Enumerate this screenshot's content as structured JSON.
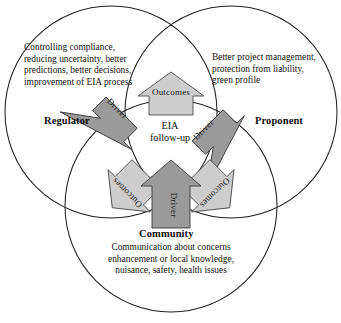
{
  "figure": {
    "type": "venn-diagram",
    "center": {
      "line1": "EIA",
      "line2": "follow-up"
    },
    "stakeholders": [
      {
        "id": "regulator",
        "name": "Regulator",
        "description_lines": [
          "Controlling compliance,",
          "reducing uncertainty, better",
          "predictions, better decisions,",
          "improvement of EIA process"
        ]
      },
      {
        "id": "proponent",
        "name": "Proponent",
        "description_lines": [
          "Better project management,",
          "protection from liability,",
          "green profile"
        ]
      },
      {
        "id": "community",
        "name": "Community",
        "description_lines": [
          "Communication about concerns",
          "enhancement or local knowledge,",
          "nuisance, safety, health issues"
        ]
      }
    ],
    "arrows": [
      {
        "id": "driver-regulator",
        "label": "Driver",
        "kind": "driver",
        "direction": "inward"
      },
      {
        "id": "driver-proponent",
        "label": "Driver",
        "kind": "driver",
        "direction": "inward"
      },
      {
        "id": "driver-community",
        "label": "Driver",
        "kind": "driver",
        "direction": "inward"
      },
      {
        "id": "outcomes-top",
        "label": "Outcomes",
        "kind": "outcomes",
        "direction": "outward"
      },
      {
        "id": "outcomes-bottom-left",
        "label": "Outcomes",
        "kind": "outcomes",
        "direction": "outward"
      },
      {
        "id": "outcomes-bottom-right",
        "label": "Outcomes",
        "kind": "outcomes",
        "direction": "outward"
      }
    ],
    "colors": {
      "driver_fill": "#9a9a9a",
      "outcomes_fill": "#cdcdcd",
      "circle_stroke": "#231f1f",
      "background": "#ffffff",
      "text": "#141414"
    }
  }
}
